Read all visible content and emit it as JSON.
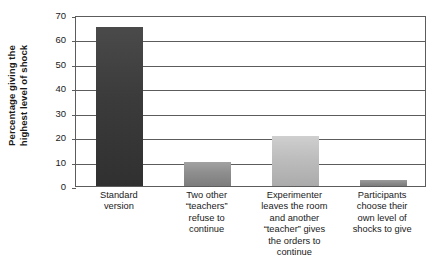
{
  "chart_data": {
    "type": "bar",
    "title": "",
    "subtitle": "",
    "xlabel": "",
    "ylabel": "Percentage giving the highest level of shock",
    "ylabel_lines": [
      "Percentage giving the",
      "highest level of shock"
    ],
    "categories": [
      "Standard version",
      "Two other \"teachers\" refuse to continue",
      "Experimenter leaves the room and another \"teacher\" gives the orders to continue",
      "Participants choose their own level of shocks to give"
    ],
    "category_lines": [
      [
        "Standard",
        "version"
      ],
      [
        "Two other",
        "“teachers”",
        "refuse to",
        "continue"
      ],
      [
        "Experimenter",
        "leaves the room",
        "and another",
        "“teacher” gives",
        "the orders to",
        "continue"
      ],
      [
        "Participants",
        "choose their",
        "own level of",
        "shocks to give"
      ]
    ],
    "values": [
      65,
      10,
      20.5,
      2.5
    ],
    "ylim": [
      0,
      70
    ],
    "yticks": [
      0,
      10,
      20,
      30,
      40,
      50,
      60,
      70
    ],
    "ytick_labels": [
      "0",
      "10",
      "20",
      "30",
      "40",
      "50",
      "60",
      "70"
    ],
    "grid": true,
    "legend": "none",
    "bar_colors": [
      "#3b3b3b",
      "#8e8e8e",
      "#bdbdbd",
      "#8c8c8c"
    ],
    "bar_color_tops": [
      "#4a4a4a",
      "#a2a2a2",
      "#cfcfcf",
      "#9c9c9c"
    ],
    "bar_color_bottoms": [
      "#303030",
      "#7d7d7d",
      "#ababab",
      "#7d7d7d"
    ],
    "axis_color": "#5c5c5c",
    "background_color": "#ffffff",
    "text_color": "#1a1a1a"
  }
}
